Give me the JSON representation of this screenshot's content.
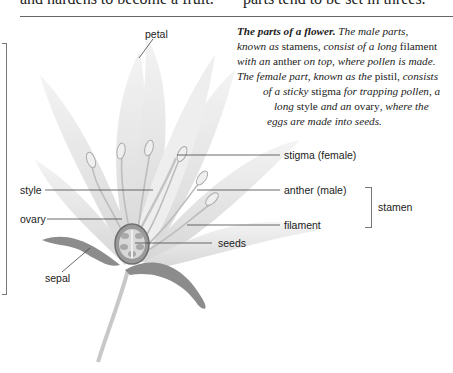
{
  "top_text": {
    "left_fragment": "and hardens to become a fruit.",
    "right_fragment": "parts tend to be set in threes."
  },
  "caption": {
    "title": "The parts of a flower.",
    "lines": [
      {
        "segments": [
          {
            "t": "The male parts,",
            "s": "i"
          }
        ]
      },
      {
        "segments": [
          {
            "t": "known as ",
            "s": "i"
          },
          {
            "t": "stamens",
            "s": "n"
          },
          {
            "t": ", consist of a long ",
            "s": "i"
          },
          {
            "t": "filament",
            "s": "n"
          }
        ]
      },
      {
        "segments": [
          {
            "t": "with an ",
            "s": "i"
          },
          {
            "t": "anther",
            "s": "n"
          },
          {
            "t": " on top, where pollen is made.",
            "s": "i"
          }
        ]
      },
      {
        "segments": [
          {
            "t": "The female part, known as the ",
            "s": "i"
          },
          {
            "t": "pistil",
            "s": "n"
          },
          {
            "t": ", consists",
            "s": "i"
          }
        ]
      },
      {
        "segments": [
          {
            "t": "of a sticky ",
            "s": "i"
          },
          {
            "t": "stigma",
            "s": "n"
          },
          {
            "t": " for trapping pollen, a",
            "s": "i"
          }
        ]
      },
      {
        "segments": [
          {
            "t": "long ",
            "s": "i"
          },
          {
            "t": "style",
            "s": "n"
          },
          {
            "t": " and an ",
            "s": "i"
          },
          {
            "t": "ovary",
            "s": "n"
          },
          {
            "t": ", where the",
            "s": "i"
          }
        ]
      },
      {
        "segments": [
          {
            "t": "eggs are made into seeds.",
            "s": "i"
          }
        ]
      }
    ]
  },
  "diagram": {
    "labels": {
      "petal": "petal",
      "stigma": "stigma (female)",
      "style": "style",
      "anther": "anther (male)",
      "stamen": "stamen",
      "ovary": "ovary",
      "filament": "filament",
      "seeds": "seeds",
      "sepal": "sepal"
    },
    "colors": {
      "petal": "#e6e6e6",
      "sepal": "#8a8a8a",
      "leader_line": "#444444",
      "bracket": "#777777"
    }
  }
}
